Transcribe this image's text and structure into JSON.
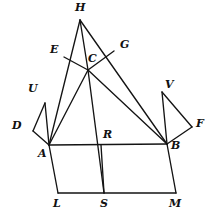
{
  "figure": {
    "width": 218,
    "height": 222,
    "background_color": "#ffffff",
    "stroke_color": "#141414",
    "stroke_width": 1.35,
    "label_color": "#111111"
  },
  "points": {
    "H": {
      "label": "H",
      "x": 80,
      "y": 20,
      "label_x": 75,
      "label_y": 2
    },
    "E": {
      "label": "E",
      "x": 64,
      "y": 57,
      "label_x": 50,
      "label_y": 44
    },
    "C": {
      "label": "C",
      "x": 88,
      "y": 70,
      "label_x": 88,
      "label_y": 53
    },
    "G": {
      "label": "G",
      "x": 114,
      "y": 51,
      "label_x": 120,
      "label_y": 39
    },
    "U": {
      "label": "U",
      "x": 45,
      "y": 103,
      "label_x": 28,
      "label_y": 83
    },
    "V": {
      "label": "V",
      "x": 162,
      "y": 92,
      "label_x": 165,
      "label_y": 79
    },
    "D": {
      "label": "D",
      "x": 33,
      "y": 131,
      "label_x": 12,
      "label_y": 120
    },
    "F": {
      "label": "F",
      "x": 192,
      "y": 127,
      "label_x": 196,
      "label_y": 118
    },
    "A": {
      "label": "A",
      "x": 49,
      "y": 145,
      "label_x": 38,
      "label_y": 148
    },
    "R": {
      "label": "R",
      "x": 101,
      "y": 145,
      "label_x": 103,
      "label_y": 129
    },
    "B": {
      "label": "B",
      "x": 167,
      "y": 144,
      "label_x": 171,
      "label_y": 140
    },
    "L": {
      "label": "L",
      "x": 58,
      "y": 193,
      "label_x": 53,
      "label_y": 198
    },
    "S": {
      "label": "S",
      "x": 104,
      "y": 193,
      "label_x": 100,
      "label_y": 198
    },
    "M": {
      "label": "M",
      "x": 176,
      "y": 193,
      "label_x": 169,
      "label_y": 198
    }
  },
  "segments": [
    {
      "name": "segment-H-A",
      "from": "H",
      "to": "A"
    },
    {
      "name": "segment-H-C",
      "from": "H",
      "to": "C"
    },
    {
      "name": "segment-H-B",
      "from": "H",
      "to": "B"
    },
    {
      "name": "segment-E-C",
      "from": "E",
      "to": "C"
    },
    {
      "name": "segment-C-G",
      "from": "C",
      "to": "G"
    },
    {
      "name": "segment-C-A",
      "from": "C",
      "to": "A"
    },
    {
      "name": "segment-C-B",
      "from": "C",
      "to": "B"
    },
    {
      "name": "segment-C-S",
      "from": "C",
      "to": "S"
    },
    {
      "name": "segment-U-D",
      "from": "U",
      "to": "D"
    },
    {
      "name": "segment-D-A",
      "from": "D",
      "to": "A"
    },
    {
      "name": "segment-U-A",
      "from": "U",
      "to": "A"
    },
    {
      "name": "segment-V-F",
      "from": "V",
      "to": "F"
    },
    {
      "name": "segment-F-B",
      "from": "F",
      "to": "B"
    },
    {
      "name": "segment-V-B",
      "from": "V",
      "to": "B"
    },
    {
      "name": "segment-A-B",
      "from": "A",
      "to": "B"
    },
    {
      "name": "segment-A-L",
      "from": "A",
      "to": "L"
    },
    {
      "name": "segment-B-M",
      "from": "B",
      "to": "M"
    },
    {
      "name": "segment-L-M",
      "from": "L",
      "to": "M"
    },
    {
      "name": "segment-R-S",
      "from": "R",
      "to": "S"
    }
  ]
}
